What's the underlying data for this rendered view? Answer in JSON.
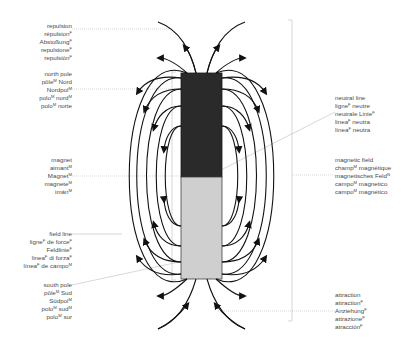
{
  "diagram": {
    "colors": {
      "north_pole": "#2a2a2a",
      "south_pole": "#cfcfcf",
      "field_line": "#111111",
      "leader_line": "#bdbdbd",
      "text": "#4a4a4a"
    },
    "magnet": {
      "x": 181,
      "y": 73,
      "width": 41,
      "height": 206,
      "split_y": 177
    }
  },
  "labels": {
    "repulsion": {
      "side": "left",
      "x": 72,
      "y": 26,
      "lines": [
        {
          "text": "repulsion",
          "gender": ""
        },
        {
          "text": "répulsion",
          "gender": "F"
        },
        {
          "text": "Abstoßung",
          "gender": "F"
        },
        {
          "text": "repulsione",
          "gender": "F"
        },
        {
          "text": "repulsión",
          "gender": "F"
        }
      ]
    },
    "north_pole": {
      "side": "left",
      "x": 72,
      "y": 70,
      "lines": [
        {
          "text": "north pole",
          "gender": ""
        },
        {
          "text": "pôle",
          "gender": "M",
          "suffix": " Nord"
        },
        {
          "text": "Nordpol",
          "gender": "M"
        },
        {
          "text": "polo",
          "gender": "M",
          "suffix": " nord",
          "gender2": "M"
        },
        {
          "text": "polo",
          "gender": "M",
          "suffix": " norte"
        }
      ]
    },
    "magnet": {
      "side": "left",
      "x": 72,
      "y": 156,
      "lines": [
        {
          "text": "magnet",
          "gender": ""
        },
        {
          "text": "aimant",
          "gender": "M"
        },
        {
          "text": "Magnet",
          "gender": "M"
        },
        {
          "text": "magnete",
          "gender": "M"
        },
        {
          "text": "imán",
          "gender": "M"
        }
      ]
    },
    "field_line": {
      "side": "left",
      "x": 72,
      "y": 230,
      "lines": [
        {
          "text": "field line",
          "gender": ""
        },
        {
          "text": "ligne",
          "gender": "F",
          "suffix": " de force",
          "gender2": "F"
        },
        {
          "text": "Feldlinie",
          "gender": "F"
        },
        {
          "text": "linea",
          "gender": "F",
          "suffix": " di forza",
          "gender2": "F"
        },
        {
          "text": "línea",
          "gender": "F",
          "suffix": " de campo",
          "gender2": "M"
        }
      ]
    },
    "south_pole": {
      "side": "left",
      "x": 72,
      "y": 281,
      "lines": [
        {
          "text": "south pole",
          "gender": ""
        },
        {
          "text": "pôle",
          "gender": "M",
          "suffix": " Sud"
        },
        {
          "text": "Südpol",
          "gender": "M"
        },
        {
          "text": "polo",
          "gender": "M",
          "suffix": " sud",
          "gender2": "M"
        },
        {
          "text": "polo",
          "gender": "M",
          "suffix": " sur"
        }
      ]
    },
    "neutral_line": {
      "side": "right",
      "x": 335,
      "y": 94,
      "lines": [
        {
          "text": "neutral line",
          "gender": ""
        },
        {
          "text": "ligne",
          "gender": "F",
          "suffix": " neutre"
        },
        {
          "text": "neutrale Linie",
          "gender": "F"
        },
        {
          "text": "linea",
          "gender": "F",
          "suffix": " neutra"
        },
        {
          "text": "línea",
          "gender": "F",
          "suffix": " neutra"
        }
      ]
    },
    "magnetic_field": {
      "side": "right",
      "x": 335,
      "y": 156,
      "lines": [
        {
          "text": "magnetic field",
          "gender": ""
        },
        {
          "text": "champ",
          "gender": "M",
          "suffix": " magnétique"
        },
        {
          "text": "magnetisches Feld",
          "gender": "N"
        },
        {
          "text": "campo",
          "gender": "M",
          "suffix": " magnetico"
        },
        {
          "text": "campo",
          "gender": "M",
          "suffix": " magnético"
        }
      ]
    },
    "attraction": {
      "side": "right",
      "x": 335,
      "y": 291,
      "lines": [
        {
          "text": "attraction",
          "gender": ""
        },
        {
          "text": "attraction",
          "gender": "F"
        },
        {
          "text": "Anziehung",
          "gender": "F"
        },
        {
          "text": "attrazione",
          "gender": "F"
        },
        {
          "text": "atracción",
          "gender": "F"
        }
      ]
    }
  }
}
